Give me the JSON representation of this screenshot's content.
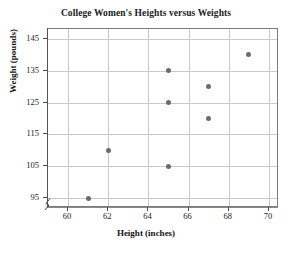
{
  "chart_data": {
    "type": "scatter",
    "title": "College Women's Heights versus Weights",
    "xlabel": "Height (inches)",
    "ylabel": "Weight (pounds)",
    "xlim": [
      59,
      70.5
    ],
    "ylim": [
      92,
      148
    ],
    "xticks": [
      60,
      62,
      64,
      66,
      68,
      70
    ],
    "yticks": [
      95,
      105,
      115,
      125,
      135,
      145
    ],
    "grid": true,
    "legend": null,
    "x": [
      61,
      62,
      65,
      65,
      65,
      67,
      67,
      69
    ],
    "y": [
      95,
      110,
      105,
      125,
      135,
      120,
      130,
      140
    ],
    "points": [
      {
        "x": 61,
        "y": 95
      },
      {
        "x": 62,
        "y": 110
      },
      {
        "x": 65,
        "y": 105
      },
      {
        "x": 65,
        "y": 125
      },
      {
        "x": 65,
        "y": 135
      },
      {
        "x": 67,
        "y": 120
      },
      {
        "x": 67,
        "y": 130
      },
      {
        "x": 69,
        "y": 140
      }
    ],
    "marker_color": "#6b6b6b",
    "grid_color": "#c9c9c9",
    "axis_color": "#7a7a7a",
    "axis_break": true
  }
}
